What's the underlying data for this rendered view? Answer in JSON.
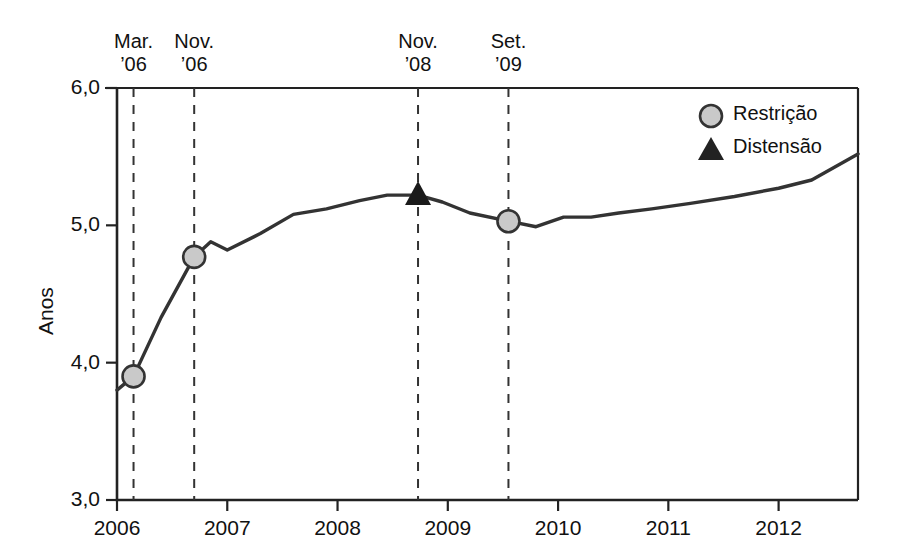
{
  "chart_data": {
    "type": "line",
    "title": "",
    "xlabel": "",
    "ylabel": "Anos",
    "xlim": [
      2006.0,
      2012.72
    ],
    "ylim": [
      3.0,
      6.0
    ],
    "grid": false,
    "legend_position": "top-right",
    "y_ticks": [
      "3,0",
      "4,0",
      "5,0",
      "6,0"
    ],
    "y_tick_values": [
      3.0,
      4.0,
      5.0,
      6.0
    ],
    "x_ticks": [
      "2006",
      "2007",
      "2008",
      "2009",
      "2010",
      "2011",
      "2012"
    ],
    "x_tick_values": [
      2006,
      2007,
      2008,
      2009,
      2010,
      2011,
      2012
    ],
    "series": [
      {
        "name": "Anos",
        "x": [
          2006.0,
          2006.15,
          2006.4,
          2006.7,
          2006.85,
          2007.0,
          2007.3,
          2007.6,
          2007.9,
          2008.2,
          2008.45,
          2008.73,
          2008.95,
          2009.2,
          2009.55,
          2009.8,
          2010.05,
          2010.3,
          2010.55,
          2010.85,
          2011.2,
          2011.6,
          2012.0,
          2012.3,
          2012.72
        ],
        "y": [
          3.8,
          3.9,
          4.33,
          4.77,
          4.88,
          4.82,
          4.94,
          5.08,
          5.12,
          5.18,
          5.22,
          5.22,
          5.17,
          5.09,
          5.03,
          4.99,
          5.06,
          5.06,
          5.09,
          5.12,
          5.16,
          5.21,
          5.27,
          5.33,
          5.52
        ]
      }
    ],
    "event_lines": [
      {
        "id": "mar-06",
        "label_line1": "Mar.",
        "label_line2": "’06",
        "x": 2006.15,
        "marker": "circle",
        "y": 3.9
      },
      {
        "id": "nov-06",
        "label_line1": "Nov.",
        "label_line2": "’06",
        "x": 2006.7,
        "marker": "circle",
        "y": 4.77
      },
      {
        "id": "nov-08",
        "label_line1": "Nov.",
        "label_line2": "’08",
        "x": 2008.73,
        "marker": "triangle",
        "y": 5.22
      },
      {
        "id": "set-09",
        "label_line1": "Set.",
        "label_line2": "’09",
        "x": 2009.55,
        "marker": "circle",
        "y": 5.03
      }
    ],
    "legend": [
      {
        "marker": "circle",
        "label": "Restrição",
        "color": "#c9c9c9"
      },
      {
        "marker": "triangle",
        "label": "Distensão",
        "color": "#222222"
      }
    ],
    "colors": {
      "line": "#333333",
      "axis": "#222222",
      "marker_fill": "#c9c9c9",
      "marker_stroke": "#333333",
      "triangle_fill": "#1a1a1a",
      "event_dash": "#333333"
    }
  }
}
